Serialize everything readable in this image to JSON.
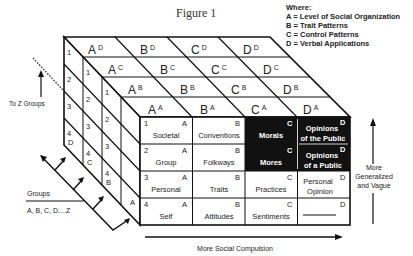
{
  "figure_title": "Figure 1",
  "legend": {
    "heading": "Where:",
    "items": [
      "A = Level of Social Organization",
      "B = Trait Patterns",
      "C = Control Patterns",
      "D = Verbal Applications"
    ]
  },
  "top_face": {
    "rows": [
      [
        "A",
        "B",
        "C",
        "D"
      ],
      [
        "A",
        "B",
        "C",
        "D"
      ],
      [
        "A",
        "B",
        "C",
        "D"
      ],
      [
        "A",
        "B",
        "C",
        "D"
      ]
    ],
    "row_superscripts": [
      "D",
      "C",
      "B",
      "A"
    ]
  },
  "front_face": {
    "cells": [
      [
        {
          "num": "1",
          "letter": "A",
          "text": "Societal",
          "dark": false
        },
        {
          "num": "",
          "letter": "B",
          "text": "Conventions",
          "dark": false
        },
        {
          "num": "",
          "letter": "C",
          "text": "Morals",
          "dark": true
        },
        {
          "num": "",
          "letter": "D",
          "text": "Opinions of the Public",
          "line1": "Opinions",
          "line2": "of the Public",
          "dark": true
        }
      ],
      [
        {
          "num": "2",
          "letter": "A",
          "text": "Group",
          "dark": false
        },
        {
          "num": "",
          "letter": "B",
          "text": "Folkways",
          "dark": false
        },
        {
          "num": "",
          "letter": "C",
          "text": "Mores",
          "dark": true
        },
        {
          "num": "",
          "letter": "D",
          "text": "Opinions of a Public",
          "line1": "Opinions",
          "line2": "of a Public",
          "dark": true
        }
      ],
      [
        {
          "num": "3",
          "letter": "A",
          "text": "Personal",
          "dark": false
        },
        {
          "num": "",
          "letter": "B",
          "text": "Traits",
          "dark": false
        },
        {
          "num": "",
          "letter": "C",
          "text": "Practices",
          "dark": false
        },
        {
          "num": "",
          "letter": "D",
          "text": "Personal Opinion",
          "line1": "Personal",
          "line2": "Opinion",
          "dark": false
        }
      ],
      [
        {
          "num": "4",
          "letter": "A",
          "text": "Self",
          "dark": false
        },
        {
          "num": "",
          "letter": "B",
          "text": "Attitudes",
          "dark": false
        },
        {
          "num": "",
          "letter": "C",
          "text": "Sentiments",
          "dark": false
        },
        {
          "num": "",
          "letter": "D",
          "text": "———",
          "dark": false
        }
      ]
    ]
  },
  "side_faces": [
    {
      "labels": [
        "1",
        "2",
        "3",
        "4"
      ],
      "group": "D"
    },
    {
      "labels": [
        "1",
        "2",
        "3",
        "4"
      ],
      "group": "C"
    },
    {
      "labels": [
        "1",
        "2",
        "3",
        "4"
      ],
      "group": "B"
    },
    {
      "labels": [
        "1",
        "2",
        "3",
        "4"
      ],
      "group": "A"
    }
  ],
  "axes": {
    "z_label": "To Z Groups",
    "groups_label": "Groups",
    "groups_values": "A, B, C, D....Z",
    "vertical_label": [
      "More",
      "Generalized",
      "and Vague"
    ],
    "horizontal_label": "More Social Compulsion"
  }
}
